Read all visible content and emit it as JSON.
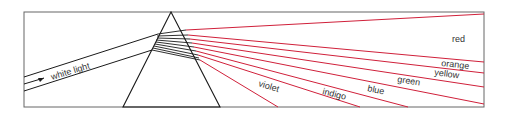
{
  "diagram": {
    "incoming_label": "white light",
    "colors": {
      "frame": "#555555",
      "ray_inside": "#1a1a1a",
      "ray_out": "#d0203a"
    },
    "spectrum": [
      {
        "name": "red",
        "label": "red"
      },
      {
        "name": "orange",
        "label": "orange"
      },
      {
        "name": "yellow",
        "label": "yellow"
      },
      {
        "name": "green",
        "label": "green"
      },
      {
        "name": "blue",
        "label": "blue"
      },
      {
        "name": "indigo",
        "label": "indigo"
      },
      {
        "name": "violet",
        "label": "violet"
      }
    ]
  }
}
